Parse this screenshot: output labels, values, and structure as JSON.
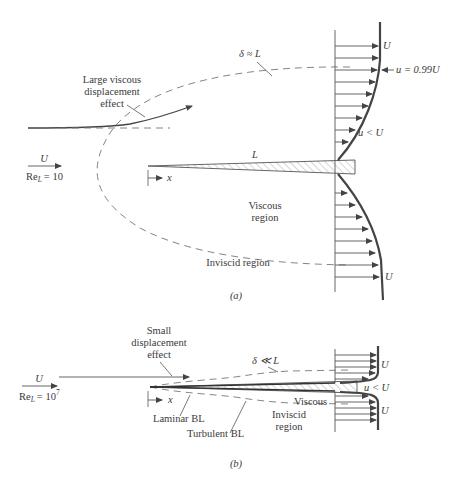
{
  "figure": {
    "panel_a": {
      "caption": "(a)",
      "freestream": {
        "velocity_label": "U",
        "reynolds_label": "Re",
        "reynolds_sub": "L",
        "reynolds_value": "= 10"
      },
      "annotations": {
        "displacement_line1": "Large viscous",
        "displacement_line2": "displacement",
        "displacement_line3": "effect",
        "delta": "δ ≈ L",
        "plate_length": "L",
        "x_axis": "x",
        "viscous_line1": "Viscous",
        "viscous_line2": "region",
        "inviscid": "Inviscid region",
        "edge_velocity": "u = 0.99U",
        "inner_velocity": "u < U",
        "top_U": "U",
        "bottom_U": "U"
      }
    },
    "panel_b": {
      "caption": "(b)",
      "freestream": {
        "velocity_label": "U",
        "reynolds_label": "Re",
        "reynolds_sub": "L",
        "reynolds_value": "= 10",
        "reynolds_exp": "7"
      },
      "annotations": {
        "displacement_line1": "Small",
        "displacement_line2": "displacement",
        "displacement_line3": "effect",
        "delta": "δ ≪ L",
        "x_axis": "x",
        "laminar": "Laminar BL",
        "turbulent": "Turbulent BL",
        "viscous": "Viscous",
        "inviscid_line1": "Inviscid",
        "inviscid_line2": "region",
        "inner_velocity": "u < U",
        "top_U": "U",
        "bottom_U": "U"
      }
    },
    "colors": {
      "line": "#555555",
      "text": "#3a3a3a",
      "background": "#ffffff"
    }
  }
}
